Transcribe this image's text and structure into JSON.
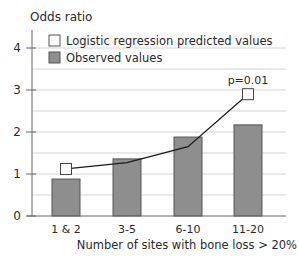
{
  "chart_data": {
    "type": "bar",
    "title": "",
    "ylabel": "Odds ratio",
    "xlabel": "Number of sites with bone loss > 20%",
    "categories": [
      "1 & 2",
      "3-5",
      "6-10",
      "11-20"
    ],
    "ylim": [
      0,
      4.5
    ],
    "yticks": [
      0,
      1,
      2,
      3,
      4
    ],
    "grid": true,
    "legend_position": "top-left",
    "series": [
      {
        "name": "Logistic regression predicted values",
        "type": "line",
        "markers": "first-and-last",
        "values": [
          1.12,
          1.27,
          1.65,
          2.9
        ]
      },
      {
        "name": "Observed values",
        "type": "bar",
        "values": [
          0.88,
          1.36,
          1.88,
          2.17
        ]
      }
    ],
    "annotations": [
      {
        "text": "p=0.01",
        "category": "11-20",
        "series": "Logistic regression predicted values"
      }
    ]
  },
  "colors": {
    "bar_fill": "#8e8e8e",
    "bar_stroke": "#555555",
    "line": "#1a1a1a",
    "marker_fill": "#ffffff",
    "grid": "#d4d4d4",
    "axis": "#666666"
  },
  "legend": {
    "items": [
      {
        "label": "Logistic regression predicted values",
        "swatch": "open-square"
      },
      {
        "label": "Observed values",
        "swatch": "gray-square"
      }
    ]
  }
}
